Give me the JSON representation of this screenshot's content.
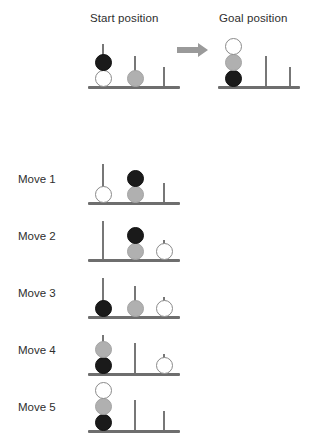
{
  "headings": {
    "start": "Start position",
    "goal": "Goal position"
  },
  "arrow": {
    "icon": "arrow-right-icon",
    "color": "#9a9a9a"
  },
  "colors": {
    "black_disc": "#1a1a1a",
    "gray_disc": "#b0b0b0",
    "white_disc": "#ffffff",
    "peg": "#777777",
    "baseline": "#6e6e6e",
    "text": "#2e2e2e"
  },
  "disc_order_bottom_to_top_goal": [
    "black",
    "gray",
    "white"
  ],
  "boards": [
    {
      "id": "start-board",
      "label": "Start position",
      "left": 88,
      "top": 38,
      "width": 92,
      "baseline_y": 48,
      "pegs": [
        {
          "x": 14,
          "height": 42
        },
        {
          "x": 46,
          "height": 30
        },
        {
          "x": 75,
          "height": 19
        }
      ],
      "discs": [
        {
          "peg": 0,
          "level": 0,
          "color": "white"
        },
        {
          "peg": 0,
          "level": 1,
          "color": "black"
        },
        {
          "peg": 1,
          "level": 0,
          "color": "gray"
        }
      ]
    },
    {
      "id": "goal-board",
      "label": "Goal position",
      "left": 218,
      "top": 38,
      "width": 82,
      "baseline_y": 48,
      "pegs": [
        {
          "x": 14,
          "height": 42
        },
        {
          "x": 47,
          "height": 30
        },
        {
          "x": 71,
          "height": 19
        }
      ],
      "discs": [
        {
          "peg": 0,
          "level": 0,
          "color": "black"
        },
        {
          "peg": 0,
          "level": 1,
          "color": "gray"
        },
        {
          "peg": 0,
          "level": 2,
          "color": "white"
        }
      ]
    },
    {
      "id": "move-1-board",
      "label": "Move 1",
      "left": 88,
      "top": 158,
      "width": 92,
      "baseline_y": 44,
      "pegs": [
        {
          "x": 14,
          "height": 38
        },
        {
          "x": 46,
          "height": 30
        },
        {
          "x": 75,
          "height": 19
        }
      ],
      "discs": [
        {
          "peg": 0,
          "level": 0,
          "color": "white"
        },
        {
          "peg": 1,
          "level": 0,
          "color": "gray"
        },
        {
          "peg": 1,
          "level": 1,
          "color": "black"
        }
      ]
    },
    {
      "id": "move-2-board",
      "label": "Move 2",
      "left": 88,
      "top": 215,
      "width": 92,
      "baseline_y": 44,
      "pegs": [
        {
          "x": 14,
          "height": 38
        },
        {
          "x": 46,
          "height": 30
        },
        {
          "x": 75,
          "height": 19
        }
      ],
      "discs": [
        {
          "peg": 1,
          "level": 0,
          "color": "gray"
        },
        {
          "peg": 1,
          "level": 1,
          "color": "black"
        },
        {
          "peg": 2,
          "level": 0,
          "color": "white"
        }
      ]
    },
    {
      "id": "move-3-board",
      "label": "Move 3",
      "left": 88,
      "top": 272,
      "width": 92,
      "baseline_y": 44,
      "pegs": [
        {
          "x": 14,
          "height": 38
        },
        {
          "x": 46,
          "height": 30
        },
        {
          "x": 75,
          "height": 19
        }
      ],
      "discs": [
        {
          "peg": 0,
          "level": 0,
          "color": "black"
        },
        {
          "peg": 1,
          "level": 0,
          "color": "gray"
        },
        {
          "peg": 2,
          "level": 0,
          "color": "white"
        }
      ]
    },
    {
      "id": "move-4-board",
      "label": "Move 4",
      "left": 88,
      "top": 329,
      "width": 92,
      "baseline_y": 44,
      "pegs": [
        {
          "x": 14,
          "height": 38
        },
        {
          "x": 46,
          "height": 30
        },
        {
          "x": 75,
          "height": 19
        }
      ],
      "discs": [
        {
          "peg": 0,
          "level": 0,
          "color": "black"
        },
        {
          "peg": 0,
          "level": 1,
          "color": "gray"
        },
        {
          "peg": 2,
          "level": 0,
          "color": "white"
        }
      ]
    },
    {
      "id": "move-5-board",
      "label": "Move 5",
      "left": 88,
      "top": 386,
      "width": 92,
      "baseline_y": 44,
      "pegs": [
        {
          "x": 14,
          "height": 38
        },
        {
          "x": 46,
          "height": 30
        },
        {
          "x": 75,
          "height": 19
        }
      ],
      "discs": [
        {
          "peg": 0,
          "level": 0,
          "color": "black"
        },
        {
          "peg": 0,
          "level": 1,
          "color": "gray"
        },
        {
          "peg": 0,
          "level": 2,
          "color": "white"
        }
      ]
    }
  ],
  "move_rows": [
    {
      "label": "Move 1",
      "label_top": 173,
      "board": "move-1-board"
    },
    {
      "label": "Move 2",
      "label_top": 230,
      "board": "move-2-board"
    },
    {
      "label": "Move 3",
      "label_top": 287,
      "board": "move-3-board"
    },
    {
      "label": "Move 4",
      "label_top": 344,
      "board": "move-4-board"
    },
    {
      "label": "Move 5",
      "label_top": 401,
      "board": "move-5-board"
    }
  ],
  "disc_size": 17
}
